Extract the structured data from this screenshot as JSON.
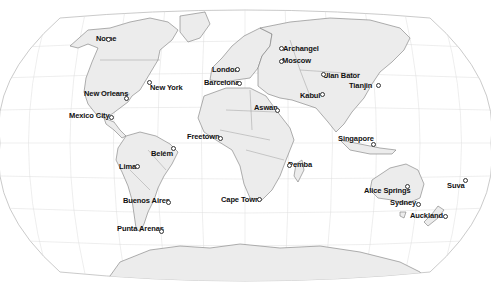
{
  "map": {
    "projection": "Winkel tripel (approx.)",
    "colors": {
      "ocean": "#ffffff",
      "land": "#ececec",
      "border": "#7a7a7a",
      "graticule": "#d8d8d8",
      "label": "#111111"
    }
  },
  "cities": [
    {
      "name": "Nome",
      "x": 96,
      "y": 35,
      "dx": 106,
      "dy": 37
    },
    {
      "name": "Archangel",
      "x": 283,
      "y": 45,
      "dx": 279,
      "dy": 46
    },
    {
      "name": "Moscow",
      "x": 282,
      "y": 57,
      "dx": 279,
      "dy": 59
    },
    {
      "name": "London",
      "x": 212,
      "y": 66,
      "dx": 235,
      "dy": 67
    },
    {
      "name": "Barcelona",
      "x": 204,
      "y": 79,
      "dx": 237,
      "dy": 81
    },
    {
      "name": "New York",
      "x": 150,
      "y": 84,
      "dx": 147,
      "dy": 80
    },
    {
      "name": "Ulan Bator",
      "x": 323,
      "y": 72,
      "dx": 321,
      "dy": 72
    },
    {
      "name": "Tianjin",
      "x": 349,
      "y": 82,
      "dx": 376,
      "dy": 83
    },
    {
      "name": "New Orleans",
      "x": 84,
      "y": 90,
      "dx": 124,
      "dy": 96
    },
    {
      "name": "Kabul",
      "x": 300,
      "y": 92,
      "dx": 320,
      "dy": 92
    },
    {
      "name": "Aswan",
      "x": 254,
      "y": 104,
      "dx": 275,
      "dy": 108
    },
    {
      "name": "Mexico City",
      "x": 69,
      "y": 112,
      "dx": 109,
      "dy": 115
    },
    {
      "name": "Singapore",
      "x": 338,
      "y": 135,
      "dx": 371,
      "dy": 142
    },
    {
      "name": "Freetown",
      "x": 187,
      "y": 133,
      "dx": 218,
      "dy": 136
    },
    {
      "name": "Belém",
      "x": 151,
      "y": 150,
      "dx": 171,
      "dy": 146
    },
    {
      "name": "Lima",
      "x": 119,
      "y": 163,
      "dx": 135,
      "dy": 164
    },
    {
      "name": "Pemba",
      "x": 288,
      "y": 161,
      "dx": 287,
      "dy": 163
    },
    {
      "name": "Alice Springs",
      "x": 364,
      "y": 187,
      "dx": 405,
      "dy": 184
    },
    {
      "name": "Suva",
      "x": 447,
      "y": 182,
      "dx": 463,
      "dy": 178
    },
    {
      "name": "Cape Town",
      "x": 221,
      "y": 196,
      "dx": 257,
      "dy": 197
    },
    {
      "name": "Buenos Aires",
      "x": 123,
      "y": 197,
      "dx": 166,
      "dy": 200
    },
    {
      "name": "Sydney",
      "x": 390,
      "y": 199,
      "dx": 416,
      "dy": 202
    },
    {
      "name": "Auckland",
      "x": 410,
      "y": 212,
      "dx": 443,
      "dy": 214
    },
    {
      "name": "Punta Arenas",
      "x": 117,
      "y": 225,
      "dx": 159,
      "dy": 229
    }
  ]
}
